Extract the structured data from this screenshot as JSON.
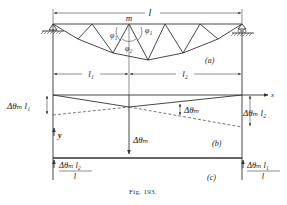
{
  "figure": {
    "caption": "Fig. 193.",
    "panel_labels": {
      "a": "(a)",
      "b": "(b)",
      "c": "(c)"
    }
  },
  "truss": {
    "span_label": "l",
    "node_label": "m",
    "angle_labels": {
      "phi1_left": "φ₁",
      "phi1_right": "φ₁",
      "phi2": "φ₂"
    },
    "segment_labels": {
      "left": "l₁",
      "right": "l₂"
    }
  },
  "deflection_diagram": {
    "x_axis_label": "x",
    "y_axis_label": "y",
    "left_offset_label": "Δθₘ l₁",
    "right_offset_label": "Δθₘ l₂",
    "angle_label": "Δθₘ",
    "load_label": "Δθₘ"
  },
  "conjugate_beam": {
    "left_reaction_numerator": "Δθₘ l₂",
    "left_reaction_denominator": "l",
    "right_reaction_numerator": "Δθₘ l₁",
    "right_reaction_denominator": "l"
  }
}
